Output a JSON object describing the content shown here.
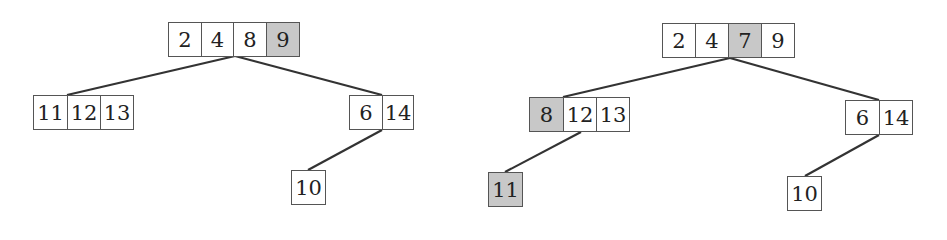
{
  "highlight_color": "#c8c8c8",
  "trees": [
    {
      "name": "left-tree",
      "nodes": [
        {
          "id": "root",
          "x": 168,
          "y": 22,
          "cells": [
            {
              "v": "2",
              "w": 34
            },
            {
              "v": "4",
              "w": 33
            },
            {
              "v": "8",
              "w": 34
            },
            {
              "v": "9",
              "w": 34,
              "hl": true
            }
          ]
        },
        {
          "id": "child-a",
          "x": 33,
          "y": 95,
          "cells": [
            {
              "v": "11",
              "w": 35
            },
            {
              "v": "12",
              "w": 34
            },
            {
              "v": "13",
              "w": 34
            }
          ]
        },
        {
          "id": "child-b",
          "x": 349,
          "y": 95,
          "cells": [
            {
              "v": "6",
              "w": 34
            },
            {
              "v": "14",
              "w": 32
            }
          ]
        },
        {
          "id": "grandchild",
          "x": 291,
          "y": 170,
          "cells": [
            {
              "v": "10",
              "w": 35
            }
          ]
        }
      ],
      "edges": [
        [
          235,
          56,
          67,
          95
        ],
        [
          235,
          56,
          382,
          95
        ],
        [
          382,
          130,
          308,
          170
        ]
      ]
    },
    {
      "name": "right-tree",
      "nodes": [
        {
          "id": "root",
          "x": 662,
          "y": 23,
          "cells": [
            {
              "v": "2",
              "w": 34
            },
            {
              "v": "4",
              "w": 34
            },
            {
              "v": "7",
              "w": 34,
              "hl": true
            },
            {
              "v": "9",
              "w": 34
            }
          ]
        },
        {
          "id": "child-a",
          "x": 529,
          "y": 97,
          "cells": [
            {
              "v": "8",
              "w": 35,
              "hl": true
            },
            {
              "v": "12",
              "w": 34
            },
            {
              "v": "13",
              "w": 34
            }
          ]
        },
        {
          "id": "child-b",
          "x": 845,
          "y": 100,
          "cells": [
            {
              "v": "6",
              "w": 35
            },
            {
              "v": "14",
              "w": 34
            }
          ]
        },
        {
          "id": "grandchild-left",
          "x": 488,
          "y": 172,
          "cells": [
            {
              "v": "11",
              "w": 35,
              "hl": true
            }
          ]
        },
        {
          "id": "grandchild-right",
          "x": 787,
          "y": 176,
          "cells": [
            {
              "v": "10",
              "w": 35
            }
          ]
        }
      ],
      "edges": [
        [
          730,
          58,
          563,
          97
        ],
        [
          730,
          58,
          879,
          100
        ],
        [
          581,
          132,
          505,
          172
        ],
        [
          879,
          135,
          805,
          176
        ]
      ]
    }
  ]
}
